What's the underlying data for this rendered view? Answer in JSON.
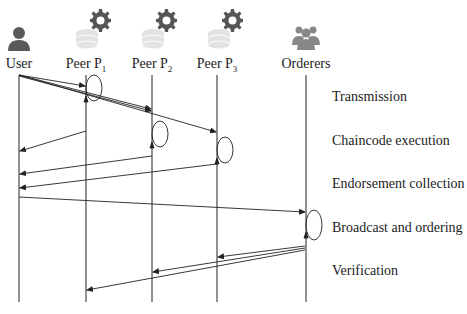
{
  "diagram": {
    "type": "sequence",
    "actors": [
      {
        "id": "user",
        "label": "User",
        "sub": "",
        "icon": "user-icon",
        "x": 19
      },
      {
        "id": "p1",
        "label": "Peer P",
        "sub": "1",
        "icon": "peer-database-gear-icon",
        "x": 86
      },
      {
        "id": "p2",
        "label": "Peer P",
        "sub": "2",
        "icon": "peer-database-gear-icon",
        "x": 152
      },
      {
        "id": "p3",
        "label": "Peer P",
        "sub": "3",
        "icon": "peer-database-gear-icon",
        "x": 217
      },
      {
        "id": "orderers",
        "label": "Orderers",
        "sub": "",
        "icon": "group-icon",
        "x": 306
      }
    ],
    "phases": [
      {
        "label": "Transmission",
        "y": 97
      },
      {
        "label": "Chaincode execution",
        "y": 141
      },
      {
        "label": "Endorsement collection",
        "y": 184
      },
      {
        "label": "Broadcast and ordering",
        "y": 228
      },
      {
        "label": "Verification",
        "y": 271
      }
    ],
    "messages": [
      {
        "from": "user",
        "to": "p1",
        "phase": "Transmission"
      },
      {
        "from": "user",
        "to": "p2",
        "phase": "Transmission"
      },
      {
        "from": "user",
        "to": "p3",
        "phase": "Transmission"
      },
      {
        "self": "p1",
        "phase": "Chaincode execution"
      },
      {
        "self": "p2",
        "phase": "Chaincode execution"
      },
      {
        "self": "p3",
        "phase": "Chaincode execution"
      },
      {
        "from": "p1",
        "to": "user",
        "phase": "Endorsement collection"
      },
      {
        "from": "p2",
        "to": "user",
        "phase": "Endorsement collection"
      },
      {
        "from": "p3",
        "to": "user",
        "phase": "Endorsement collection"
      },
      {
        "from": "user",
        "to": "orderers",
        "phase": "Broadcast and ordering"
      },
      {
        "self": "orderers",
        "phase": "Broadcast and ordering"
      },
      {
        "from": "orderers",
        "to": "p3",
        "phase": "Verification"
      },
      {
        "from": "orderers",
        "to": "p2",
        "phase": "Verification"
      },
      {
        "from": "orderers",
        "to": "p1",
        "phase": "Verification"
      }
    ]
  }
}
